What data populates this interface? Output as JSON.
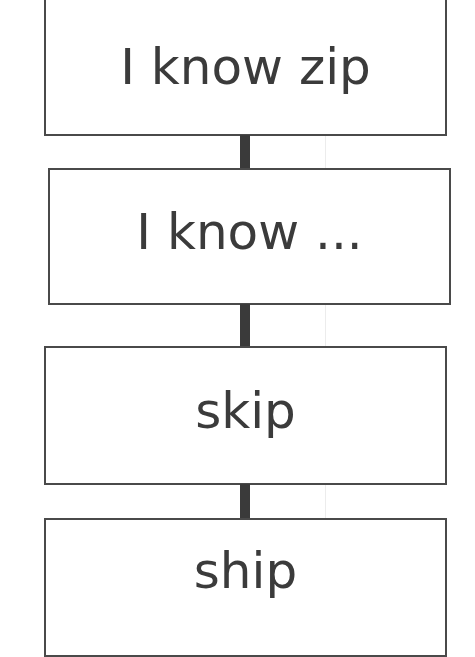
{
  "diagram": {
    "type": "vertical-flow",
    "boxes": [
      {
        "label": "I know zip"
      },
      {
        "label": "I know ..."
      },
      {
        "label": "skip"
      },
      {
        "label": "ship"
      }
    ],
    "connectors": 3,
    "colors": {
      "border": "#4a4a4a",
      "connector": "#3a3a3a",
      "text": "#3b3b3b",
      "background": "#ffffff"
    }
  }
}
